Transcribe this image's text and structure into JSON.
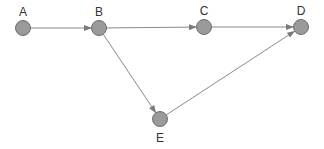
{
  "diagram": {
    "type": "directed-graph",
    "nodes": [
      {
        "id": "A",
        "label": "A",
        "x": 23,
        "y": 28,
        "label_pos": "above"
      },
      {
        "id": "B",
        "label": "B",
        "x": 99,
        "y": 28,
        "label_pos": "above"
      },
      {
        "id": "C",
        "label": "C",
        "x": 204,
        "y": 27,
        "label_pos": "above"
      },
      {
        "id": "D",
        "label": "D",
        "x": 301,
        "y": 27,
        "label_pos": "above"
      },
      {
        "id": "E",
        "label": "E",
        "x": 160,
        "y": 119,
        "label_pos": "below"
      }
    ],
    "edges": [
      {
        "from": "A",
        "to": "B"
      },
      {
        "from": "B",
        "to": "C"
      },
      {
        "from": "C",
        "to": "D"
      },
      {
        "from": "B",
        "to": "E"
      },
      {
        "from": "E",
        "to": "D"
      }
    ],
    "colors": {
      "node_fill": "#9a9a9a",
      "node_stroke": "#6e6e6e",
      "edge": "#8a8a8a",
      "label": "#333333"
    }
  }
}
